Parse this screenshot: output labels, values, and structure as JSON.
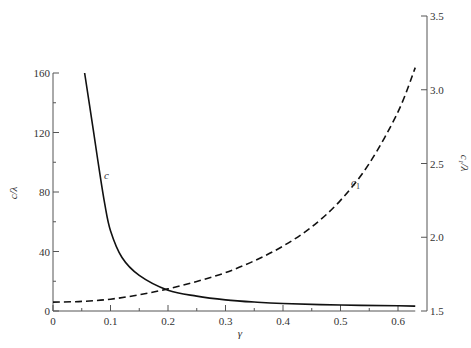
{
  "chart_data": {
    "type": "line",
    "title": "",
    "xlabel": "γ",
    "ylabel_left": "c/λ",
    "ylabel_right": "c₁/λ",
    "xlim": [
      0,
      0.65
    ],
    "ylim_left": [
      0,
      160
    ],
    "ylim_right": [
      1.5,
      3.5
    ],
    "x_ticks": [
      0,
      0.1,
      0.2,
      0.3,
      0.4,
      0.5,
      0.6
    ],
    "x_tick_labels": [
      "0",
      "0.1",
      "0.2",
      "0.3",
      "0.4",
      "0.5",
      "0.6"
    ],
    "x_minor_ticks": [
      0.05,
      0.15,
      0.25,
      0.35,
      0.45,
      0.55
    ],
    "y_left_ticks": [
      0,
      40,
      80,
      120,
      160
    ],
    "y_left_tick_labels": [
      "0",
      "40",
      "80",
      "120",
      "160"
    ],
    "y_left_minor_ticks": [
      20,
      60,
      100,
      140
    ],
    "y_right_ticks": [
      1.5,
      2.0,
      2.5,
      3.0,
      3.5
    ],
    "y_right_tick_labels": [
      "1.5",
      "2.0",
      "2.5",
      "3.0",
      "3.5"
    ],
    "grid": false,
    "legend": "inline curve labels",
    "series": [
      {
        "name": "c",
        "axis": "left",
        "style": "solid",
        "x": [
          0.055,
          0.07,
          0.08,
          0.09,
          0.1,
          0.12,
          0.15,
          0.2,
          0.25,
          0.3,
          0.35,
          0.4,
          0.5,
          0.6,
          0.63
        ],
        "y": [
          160,
          122,
          96,
          72,
          54,
          36,
          24,
          14,
          10,
          7.5,
          6,
          5,
          4,
          3.5,
          3.3
        ]
      },
      {
        "name": "c₁",
        "axis": "right",
        "style": "dashed",
        "x": [
          0,
          0.05,
          0.1,
          0.15,
          0.2,
          0.25,
          0.3,
          0.35,
          0.4,
          0.45,
          0.5,
          0.55,
          0.6,
          0.63
        ],
        "y": [
          1.56,
          1.565,
          1.58,
          1.61,
          1.65,
          1.7,
          1.76,
          1.84,
          1.94,
          2.07,
          2.25,
          2.5,
          2.85,
          3.15
        ]
      }
    ],
    "annotations": [
      {
        "text": "c",
        "x": 0.09,
        "y_left": 92
      },
      {
        "text": "c₁",
        "x": 0.52,
        "y_right": 2.42
      }
    ]
  },
  "labels": {
    "xlabel": "γ",
    "ylabel_left": "c/λ",
    "ylabel_right": "c₁/λ",
    "curve_c": "c",
    "curve_c1": "c",
    "curve_c1_sub": "1"
  },
  "colors": {
    "axis": "#555555",
    "curve": "#111111",
    "text": "#333333"
  }
}
